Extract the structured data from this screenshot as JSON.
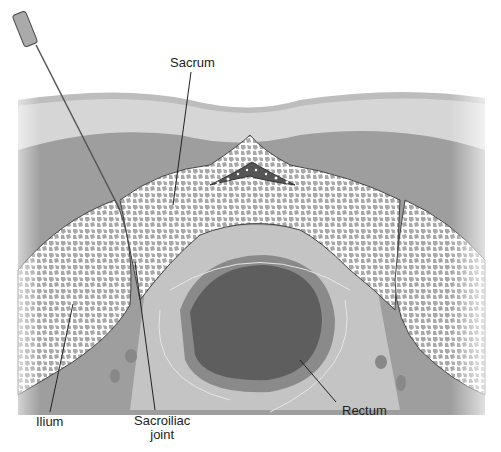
{
  "diagram": {
    "type": "anatomical cross-section",
    "labels": {
      "sacrum": "Sacrum",
      "ilium": "Ilium",
      "sacroiliac_joint_line1": "Sacroiliac",
      "sacroiliac_joint_line2": "joint",
      "rectum": "Rectum"
    },
    "elements": [
      "needle",
      "skin",
      "subcutaneous fat",
      "muscle",
      "sacrum",
      "sacral canal",
      "left ilium",
      "right ilium",
      "sacroiliac joints",
      "rectum",
      "vessels"
    ],
    "colors": {
      "skin": "#bdbdbd",
      "fat": "#d6d6d6",
      "muscle": "#9e9e9e",
      "bone_fill": "#ffffff",
      "bone_pattern": "#a8a8a8",
      "rectum_outer": "#8a8a8a",
      "rectum_inner": "#5e5e5e",
      "pelvic_tissue": "#c4c4c4",
      "canal": "#555555"
    }
  }
}
